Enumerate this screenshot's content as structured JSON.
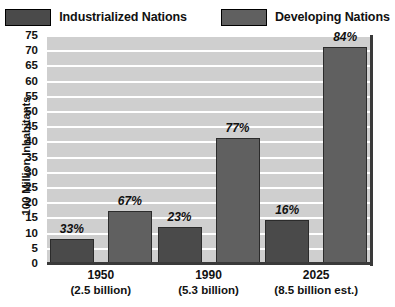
{
  "chart_data": {
    "type": "bar",
    "title": "",
    "xlabel": "",
    "ylabel": "100 Million Inhabitants",
    "ylim": [
      0,
      75
    ],
    "ytick_step": 5,
    "yticks": [
      "75",
      "70",
      "65",
      "60",
      "55",
      "50",
      "45",
      "40",
      "35",
      "30",
      "25",
      "20",
      "15",
      "10",
      "5",
      "0"
    ],
    "grid": true,
    "legend_position": "top",
    "categories": [
      "1950",
      "1990",
      "2025"
    ],
    "category_sublabels": [
      "(2.5 billion)",
      "(5.3 billion)",
      "(8.5 billion est.)"
    ],
    "series": [
      {
        "name": "Industrialized Nations",
        "color": "#4a4a4a",
        "values": [
          8,
          12,
          14
        ],
        "data_labels": [
          "33%",
          "67%",
          "16%"
        ]
      },
      {
        "name": "Developing Nations",
        "color": "#606060",
        "values": [
          17,
          41,
          71
        ],
        "data_labels": [
          "67%",
          "77%",
          "84%"
        ]
      }
    ],
    "bar_labels": [
      {
        "group": "1950",
        "series": "Industrialized Nations",
        "label": "33%",
        "value": 8
      },
      {
        "group": "1950",
        "series": "Developing Nations",
        "label": "67%",
        "value": 17
      },
      {
        "group": "1990",
        "series": "Industrialized Nations",
        "label": "23%",
        "value": 12
      },
      {
        "group": "1990",
        "series": "Developing Nations",
        "label": "77%",
        "value": 41
      },
      {
        "group": "2025",
        "series": "Industrialized Nations",
        "label": "16%",
        "value": 14
      },
      {
        "group": "2025",
        "series": "Developing Nations",
        "label": "84%",
        "value": 71
      }
    ]
  },
  "legend": {
    "items": [
      {
        "label": "Industrialized Nations",
        "color": "#4a4a4a"
      },
      {
        "label": "Developing Nations",
        "color": "#606060"
      }
    ]
  },
  "axis": {
    "y_title": "100 Million Inhabitants"
  },
  "colors": {
    "plot_background": "#cfcfcf",
    "gridline": "#ffffff",
    "axis": "#3a3a3a",
    "industrialized": "#4a4a4a",
    "developing": "#606060"
  }
}
